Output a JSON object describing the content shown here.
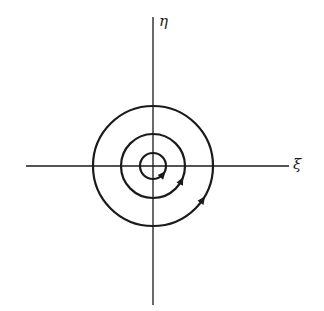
{
  "diagram": {
    "type": "phase-portrait",
    "axes": {
      "horizontal": {
        "label": "ξ",
        "x1": 26,
        "x2": 289,
        "y": 166
      },
      "vertical": {
        "label": "η",
        "y1": 17,
        "y2": 305,
        "x": 153
      }
    },
    "center": {
      "x": 153,
      "y": 166
    },
    "circles": [
      {
        "name": "inner",
        "r": 13,
        "arrow_angle_deg": 40
      },
      {
        "name": "middle",
        "r": 32,
        "arrow_angle_deg": 27
      },
      {
        "name": "outer",
        "r": 60,
        "arrow_angle_deg": 34
      }
    ],
    "arrow_direction": "counterclockwise",
    "colors": {
      "stroke": "#1a1a1a",
      "background": "#ffffff"
    }
  }
}
